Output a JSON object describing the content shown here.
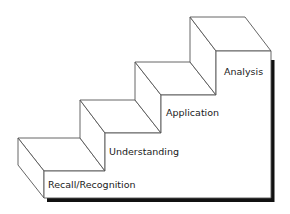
{
  "diagram": {
    "type": "staircase",
    "steps": [
      {
        "label": "Recall/Recognition",
        "level": 1
      },
      {
        "label": "Understanding",
        "level": 2
      },
      {
        "label": "Application",
        "level": 3
      },
      {
        "label": "Analysis",
        "level": 4
      }
    ],
    "colors": {
      "line": "#555555",
      "shadow": "#111111",
      "fill": "#ffffff"
    }
  }
}
